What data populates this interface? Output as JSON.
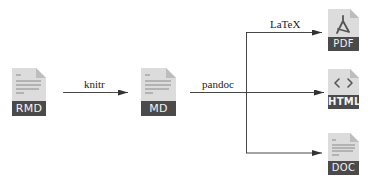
{
  "colors": {
    "page_bg": "#ffffff",
    "file_body": "#dcdcdc",
    "file_fold": "#bdbdbd",
    "file_band": "#4a4a4a",
    "band_text": "#f2f2f2",
    "line": "#333333",
    "text_lines": "#8a8a8a"
  },
  "nodes": {
    "rmd": {
      "label": "RMD",
      "icon": "text-lines-icon"
    },
    "md": {
      "label": "MD",
      "icon": "text-lines-icon"
    },
    "pdf": {
      "label": "PDF",
      "icon": "acrobat-icon"
    },
    "html": {
      "label": "HTML",
      "icon": "code-brackets-icon",
      "glyph": "< >"
    },
    "doc": {
      "label": "DOC",
      "icon": "text-lines-icon"
    }
  },
  "edges": [
    {
      "from": "RMD",
      "to": "MD",
      "label": "knitr"
    },
    {
      "from": "MD",
      "to": "PDF/HTML/DOC",
      "label": "pandoc"
    },
    {
      "from": "pandoc",
      "to": "PDF",
      "label": "LaTeX"
    },
    {
      "from": "pandoc",
      "to": "HTML",
      "label": ""
    },
    {
      "from": "pandoc",
      "to": "DOC",
      "label": ""
    }
  ]
}
